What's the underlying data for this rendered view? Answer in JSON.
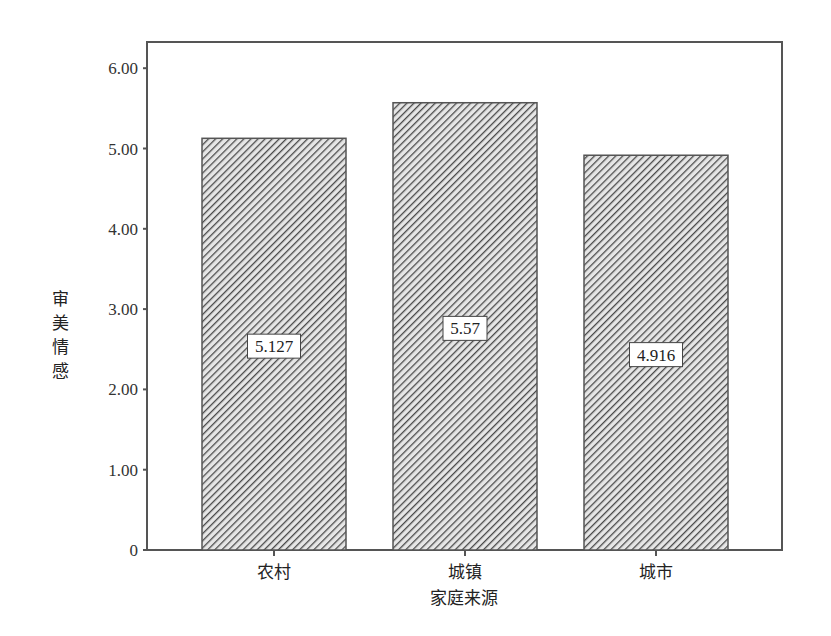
{
  "chart_data": {
    "type": "bar",
    "title": "",
    "xlabel": "家庭来源",
    "ylabel": "审美情感",
    "categories": [
      "农村",
      "城镇",
      "城市"
    ],
    "values": [
      5.127,
      5.57,
      4.916
    ],
    "data_labels": [
      "5.127",
      "5.57",
      "4.916"
    ],
    "ylim": [
      0,
      6.3
    ],
    "yticks": [
      0,
      1,
      2,
      3,
      4,
      5,
      6
    ],
    "ytick_labels": [
      "0",
      "1.00",
      "2.00",
      "3.00",
      "4.00",
      "5.00",
      "6.00"
    ],
    "grid": false,
    "legend": null,
    "bar_fill": "diagonal-hatch",
    "colors": {
      "hatch": "#555555",
      "bar_bg": "#d9d9d9",
      "frame": "#555555"
    }
  }
}
